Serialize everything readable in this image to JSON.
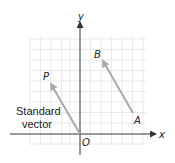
{
  "diagram": {
    "axes": {
      "x_label": "x",
      "y_label": "y",
      "origin_label": "O"
    },
    "grid": {
      "x0": 30,
      "x1": 146,
      "y0": 37,
      "y1": 145,
      "step": 10.5,
      "line_color": "#e3e3e3"
    },
    "axis_color": "#333333",
    "vector_color": "#a9a9a9",
    "vectors": [
      {
        "name": "standard-vector-OP",
        "from_label": "O",
        "to_label": "P",
        "x1": 80,
        "y1": 134,
        "x2": 51,
        "y2": 84
      },
      {
        "name": "vector-AB",
        "from_label": "A",
        "to_label": "B",
        "x1": 133,
        "y1": 113,
        "x2": 103,
        "y2": 61
      }
    ],
    "points": {
      "P": "P",
      "B": "B",
      "A": "A"
    },
    "caption": {
      "line1": "Standard",
      "line2": "vector"
    }
  }
}
